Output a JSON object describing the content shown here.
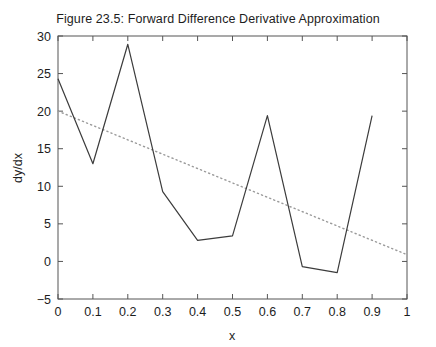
{
  "chart_data": {
    "type": "line",
    "title": "Figure 23.5: Forward Difference Derivative Approximation",
    "xlabel": "x",
    "ylabel": "dy/dx",
    "xlim": [
      0,
      1
    ],
    "ylim": [
      -5,
      30
    ],
    "grid": false,
    "legend": "none",
    "xticks": [
      "0",
      "0.1",
      "0.2",
      "0.3",
      "0.4",
      "0.5",
      "0.6",
      "0.7",
      "0.8",
      "0.9",
      "1"
    ],
    "xtick_values": [
      0,
      0.1,
      0.2,
      0.3,
      0.4,
      0.5,
      0.6,
      0.7,
      0.8,
      0.9,
      1
    ],
    "yticks": [
      "-5",
      "0",
      "5",
      "10",
      "15",
      "20",
      "25",
      "30"
    ],
    "ytick_values": [
      -5,
      0,
      5,
      10,
      15,
      20,
      25,
      30
    ],
    "series": [
      {
        "name": "forward difference derivative",
        "style": "solid",
        "color": "#3c3c3c",
        "x": [
          0,
          0.1,
          0.2,
          0.3,
          0.4,
          0.5,
          0.6,
          0.7,
          0.8,
          0.9
        ],
        "values": [
          24.3,
          13.0,
          28.9,
          9.3,
          2.8,
          3.4,
          19.4,
          -0.7,
          -1.5,
          19.4
        ]
      },
      {
        "name": "trend line",
        "style": "dotted",
        "color": "#9a9a9a",
        "x": [
          0,
          1
        ],
        "values": [
          20.0,
          0.9
        ]
      }
    ]
  },
  "axes": {
    "tick_direction": "in",
    "box": true,
    "frame_color": "#555555"
  }
}
